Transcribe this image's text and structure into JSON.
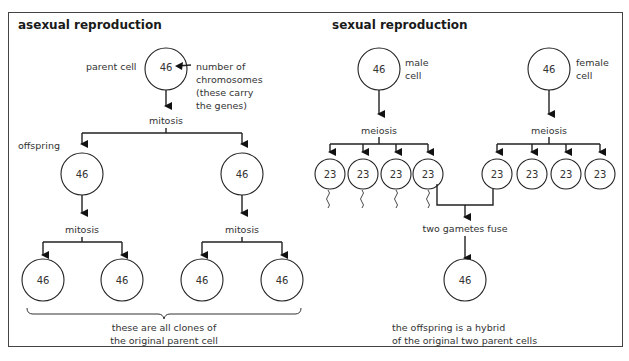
{
  "asexual": {
    "title": "asexual reproduction",
    "parent_label": "parent cell",
    "parent_value": "46",
    "annotation": [
      "number of",
      "chromosomes",
      "(these carry",
      "the genes)"
    ],
    "step1": "mitosis",
    "offspring_label": "offspring",
    "offspring_values": [
      "46",
      "46"
    ],
    "step2": [
      "mitosis",
      "mitosis"
    ],
    "clone_values": [
      "46",
      "46",
      "46",
      "46"
    ],
    "caption": [
      "these are all clones of",
      "the original parent cell"
    ]
  },
  "sexual": {
    "title": "sexual reproduction",
    "male_label": [
      "male",
      "cell"
    ],
    "male_value": "46",
    "female_label": [
      "female",
      "cell"
    ],
    "female_value": "46",
    "male_step": "meiosis",
    "female_step": "meiosis",
    "sperm_values": [
      "23",
      "23",
      "23",
      "23"
    ],
    "egg_values": [
      "23",
      "23",
      "23",
      "23"
    ],
    "fuse_label": "two gametes fuse",
    "zygote_value": "46",
    "caption": [
      "the offspring is a hybrid",
      "of the original two parent cells"
    ]
  }
}
